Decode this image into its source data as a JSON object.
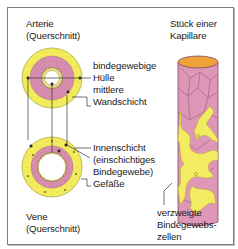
{
  "figure": {
    "artery": {
      "title_line1": "Arterie",
      "title_line2": "(Querschnitt)"
    },
    "vein": {
      "title_line1": "Vene",
      "title_line2": "(Querschnitt)"
    },
    "capillary": {
      "title_line1": "Stück einer",
      "title_line2": "Kapillare"
    },
    "labels": {
      "outer_layer_line1": "bindegewebige",
      "outer_layer_line2": "Hülle",
      "middle_layer_line1": "mittlere",
      "middle_layer_line2": "Wandschicht",
      "inner_layer_line1": "Innenschicht",
      "inner_layer_line2": "(einschichtiges",
      "inner_layer_line3": "Bindegewebe)",
      "vessels": "Gefäße",
      "branched_cells_line1": "verzweigte",
      "branched_cells_line2": "Bindegewebs-",
      "branched_cells_line3": "zellen"
    },
    "colors": {
      "outer_yellow": "#f2ec5c",
      "middle_pink": "#d98fb0",
      "inner_cream": "#efe7b0",
      "lumen": "#ffffff",
      "capillary_pink": "#de97b7",
      "capillary_top": "#f0a13a",
      "cell_yellow": "#f3ec62",
      "line": "#333333"
    }
  }
}
